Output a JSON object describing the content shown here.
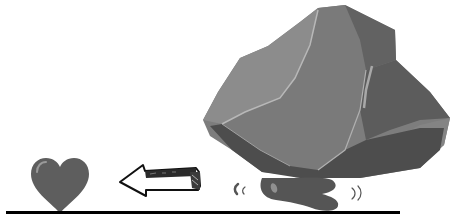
{
  "scene": {
    "description": "Grayscale illustration: a heart on the ground to the left, an arrow pointing left toward it, and a large rock crushing a squished heart on the right",
    "elements": {
      "free_heart": {
        "icon": "heart-icon",
        "fill": "#5e5e5e",
        "highlight": "#9a9a9a"
      },
      "arrow": {
        "icon": "arrow-left-icon",
        "direction": "left",
        "stroke": "#111111",
        "body": "#2a2a2a"
      },
      "rock": {
        "icon": "rock-icon",
        "light": "#8a8a8a",
        "mid": "#777777",
        "dark": "#5a5a5a",
        "darker": "#4a4a4a",
        "edge": "#b5b5b5"
      },
      "crushed_heart": {
        "icon": "squished-heart-icon",
        "fill": "#555555",
        "highlight": "#8f8f8f"
      },
      "motion_marks": {
        "icon": "motion-lines-icon",
        "color": "#555555"
      },
      "ground": {
        "color": "#000000"
      }
    }
  }
}
